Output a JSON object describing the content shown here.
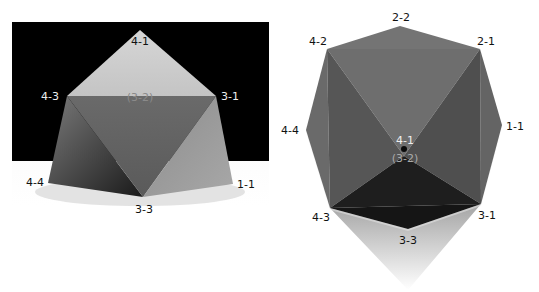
{
  "left_view": {
    "title": "photo",
    "labels": {
      "top": "4-1",
      "upper_left": "4-3",
      "upper_right": "3-1",
      "hidden": "(3-2)",
      "lower_left": "4-4",
      "bottom": "3-3",
      "lower_right": "1-1"
    }
  },
  "right_view": {
    "title": "top-down",
    "labels": {
      "top": "2-2",
      "upper_left": "4-2",
      "upper_right": "2-1",
      "left": "4-4",
      "right": "1-1",
      "center_upper": "4-1",
      "center_lower": "(3-2)",
      "lower_left": "4-3",
      "lower_right": "3-1",
      "bottom": "3-3"
    }
  },
  "colors": {
    "backdrop": "#000000",
    "label_dark": "#111111",
    "label_light": "#eeeeee",
    "label_hidden": "#8a8a8a"
  }
}
